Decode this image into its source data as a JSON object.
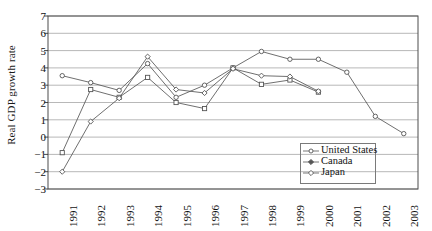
{
  "chart_data": {
    "type": "line",
    "title": "",
    "xlabel": "",
    "ylabel": "Real GDP growth rate",
    "x": [
      "1991",
      "1992",
      "1993",
      "1994",
      "1995",
      "1996",
      "1997",
      "1998",
      "1999",
      "2000",
      "2001",
      "2002",
      "2003"
    ],
    "categories": [
      "1991",
      "1992",
      "1993",
      "1994",
      "1995",
      "1996",
      "1997",
      "1998",
      "1999",
      "2000",
      "2001",
      "2002",
      "2003"
    ],
    "ylim": [
      -3,
      7
    ],
    "yticks": [
      7,
      6,
      5,
      4,
      3,
      2,
      1,
      0,
      -1,
      -2,
      -3
    ],
    "ytick_labels": [
      "7",
      "6",
      "5",
      "4",
      "3",
      "2",
      "1",
      "0",
      "−1",
      "−2",
      "−3"
    ],
    "grid": "horizontal",
    "legend_position": "bottom-right",
    "series": [
      {
        "name": "United States",
        "marker": "circle",
        "color": "#555555",
        "values": [
          3.55,
          3.15,
          2.7,
          4.25,
          2.3,
          3.0,
          4.0,
          4.95,
          4.5,
          4.5,
          3.75,
          1.2,
          0.2
        ]
      },
      {
        "name": "Canada",
        "marker": "square",
        "color": "#555555",
        "values": [
          -0.9,
          2.75,
          2.3,
          3.45,
          2.0,
          1.65,
          4.0,
          3.05,
          3.3,
          2.6,
          null,
          null,
          null
        ]
      },
      {
        "name": "Japan",
        "marker": "diamond",
        "color": "#555555",
        "values": [
          -2.0,
          0.9,
          2.25,
          4.65,
          2.75,
          2.55,
          3.95,
          3.55,
          3.5,
          2.65,
          null,
          null,
          null
        ]
      }
    ]
  },
  "legend": {
    "items": [
      {
        "label": "United States",
        "marker": "circle"
      },
      {
        "label": "Canada",
        "marker": "diamond-filled"
      },
      {
        "label": "Japan",
        "marker": "diamond"
      }
    ]
  },
  "axis": {
    "y_title": "Real GDP growth rate"
  }
}
